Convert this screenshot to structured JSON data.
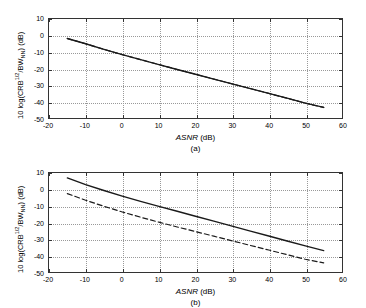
{
  "figure": {
    "background": "#ffffff",
    "line_color": "#1a1a1a"
  },
  "panels": [
    {
      "id": "a",
      "caption": "(a)",
      "xlabel_italic": "ASNR",
      "xlabel_unit": " (dB)",
      "ylabel_prefix": "10 log(CRB",
      "ylabel_sup": "1/2",
      "ylabel_mid": "/BW",
      "ylabel_sub": "NN",
      "ylabel_suffix": ") (dB)",
      "xticks": [
        "-20",
        "-10",
        "0",
        "10",
        "20",
        "30",
        "40",
        "50",
        "60"
      ],
      "yticks": [
        "10",
        "0",
        "-10",
        "-20",
        "-30",
        "-40",
        "-50"
      ]
    },
    {
      "id": "b",
      "caption": "(b)",
      "xlabel_italic": "ASNR",
      "xlabel_unit": " (dB)",
      "ylabel_prefix": "10 log(CRB",
      "ylabel_sup": "1/2",
      "ylabel_mid": "/BW",
      "ylabel_sub": "NN",
      "ylabel_suffix": ") (dB)",
      "xticks": [
        "-20",
        "-10",
        "0",
        "10",
        "20",
        "30",
        "40",
        "50",
        "60"
      ],
      "yticks": [
        "10",
        "0",
        "-10",
        "-20",
        "-30",
        "-40",
        "-50"
      ]
    }
  ],
  "chart_data": [
    {
      "type": "line",
      "title": "(a)",
      "xlabel": "ASNR (dB)",
      "ylabel": "10 log(CRB^1/2/BW_NN) (dB)",
      "xlim": [
        -20,
        60
      ],
      "ylim": [
        -50,
        10
      ],
      "xticks": [
        -20,
        -10,
        0,
        10,
        20,
        30,
        40,
        50,
        60
      ],
      "yticks": [
        -50,
        -40,
        -30,
        -20,
        -10,
        0,
        10
      ],
      "grid": true,
      "legend": null,
      "series": [
        {
          "name": "solid",
          "style": "solid",
          "x": [
            -15,
            -10,
            -5,
            0,
            5,
            10,
            15,
            20,
            25,
            30,
            35,
            40,
            45,
            50,
            55
          ],
          "y": [
            -1.8,
            -5.0,
            -8.4,
            -11.6,
            -14.6,
            -17.6,
            -20.6,
            -23.5,
            -26.4,
            -29.3,
            -32.2,
            -35.1,
            -38.0,
            -41.0,
            -43.6
          ]
        },
        {
          "name": "dashed",
          "style": "dashed",
          "x": [
            -15,
            -10,
            -5,
            0,
            5,
            10,
            15,
            20,
            25,
            30,
            35,
            40,
            45,
            50,
            55
          ],
          "y": [
            -1.8,
            -5.0,
            -8.4,
            -11.6,
            -14.6,
            -17.6,
            -20.6,
            -23.5,
            -26.4,
            -29.3,
            -32.2,
            -35.1,
            -38.0,
            -41.0,
            -43.6
          ]
        }
      ]
    },
    {
      "type": "line",
      "title": "(b)",
      "xlabel": "ASNR (dB)",
      "ylabel": "10 log(CRB^1/2/BW_NN) (dB)",
      "xlim": [
        -20,
        60
      ],
      "ylim": [
        -50,
        10
      ],
      "xticks": [
        -20,
        -10,
        0,
        10,
        20,
        30,
        40,
        50,
        60
      ],
      "yticks": [
        -50,
        -40,
        -30,
        -20,
        -10,
        0,
        10
      ],
      "grid": true,
      "legend": null,
      "series": [
        {
          "name": "solid",
          "style": "solid",
          "x": [
            -15,
            -10,
            -5,
            0,
            5,
            10,
            15,
            20,
            25,
            30,
            35,
            40,
            45,
            50,
            55
          ],
          "y": [
            7.0,
            3.0,
            -0.6,
            -4.0,
            -7.2,
            -10.2,
            -13.2,
            -16.2,
            -19.2,
            -22.2,
            -25.2,
            -28.2,
            -31.2,
            -34.2,
            -37.0
          ]
        },
        {
          "name": "dashed",
          "style": "dashed",
          "x": [
            -15,
            -10,
            -5,
            0,
            5,
            10,
            15,
            20,
            25,
            30,
            35,
            40,
            45,
            50,
            55
          ],
          "y": [
            -2.5,
            -6.5,
            -10.2,
            -13.6,
            -16.8,
            -19.8,
            -22.7,
            -25.5,
            -28.3,
            -31.1,
            -33.9,
            -36.7,
            -39.5,
            -42.3,
            -44.5
          ]
        }
      ]
    }
  ]
}
